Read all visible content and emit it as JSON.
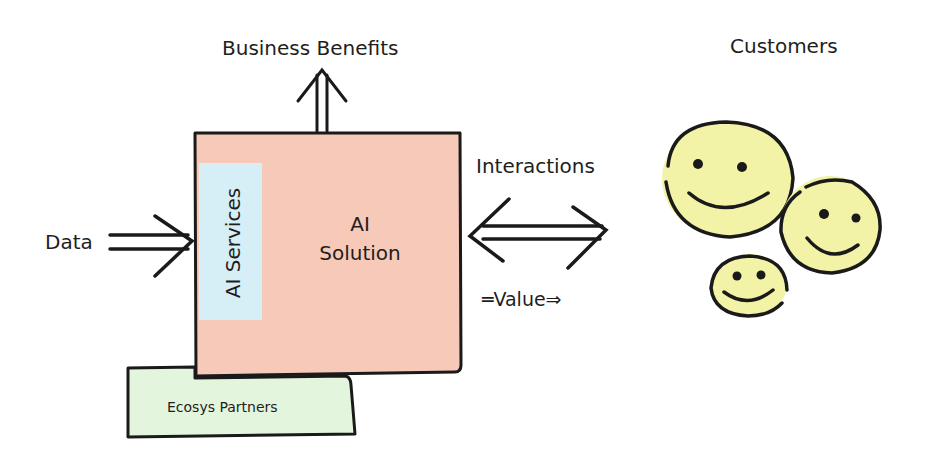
{
  "diagram": {
    "title_top": "Business Benefits",
    "customers_label": "Customers",
    "data_label": "Data",
    "interactions_label": "Interactions",
    "value_label": "═Value⇒",
    "solution_label_line1": "AI",
    "solution_label_line2": "Solution",
    "services_label": "AI Services",
    "partners_label": "Ecosys Partners",
    "colors": {
      "solution_fill": "#f7c9b8",
      "services_fill": "#d6eef6",
      "partners_fill": "#e3f5dc",
      "face_fill": "#f3f3a8",
      "stroke": "#1a1a1a"
    },
    "customers": [
      {
        "name": "large-face"
      },
      {
        "name": "medium-face"
      },
      {
        "name": "small-face"
      }
    ]
  }
}
